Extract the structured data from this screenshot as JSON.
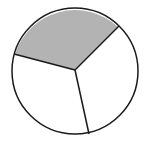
{
  "figure": {
    "type": "fraction-circle",
    "total_parts": 3,
    "shaded_parts": 1,
    "colors": {
      "shaded": "#b3b3b3",
      "unshaded": "#ffffff",
      "stroke": "#1a1a1a"
    },
    "geometry": {
      "cx": 75,
      "cy": 70,
      "r": 63,
      "spoke_endpoints": [
        [
          15,
          54
        ],
        [
          118,
          27
        ],
        [
          89,
          134
        ]
      ]
    }
  }
}
